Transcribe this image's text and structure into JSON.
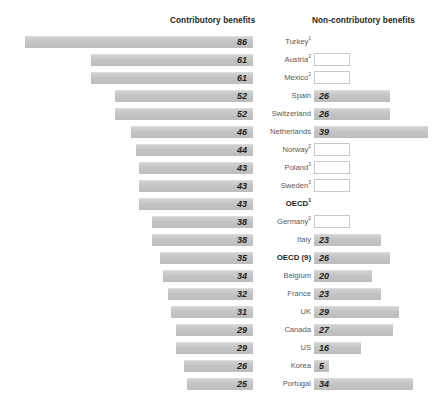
{
  "headers": {
    "left": "Contributory benefits",
    "right": "Non-contributory benefits"
  },
  "chart_data": {
    "type": "bar",
    "title": "",
    "subtitle": "",
    "orientation": "horizontal",
    "layout": "diverging-back-to-back",
    "xlabel": "",
    "ylabel": "",
    "grid": false,
    "legend_position": "top",
    "categories": [
      "Turkey",
      "Austria",
      "Mexico",
      "Spain",
      "Switzerland",
      "Netherlands",
      "Norway",
      "Poland",
      "Sweden",
      "OECD",
      "Germany",
      "Italy",
      "OECD (9)",
      "Belgium",
      "France",
      "UK",
      "Canada",
      "US",
      "Korea",
      "Portugal"
    ],
    "series": [
      {
        "name": "Contributory benefits",
        "values": [
          86,
          61,
          61,
          52,
          52,
          46,
          44,
          43,
          43,
          43,
          38,
          38,
          35,
          34,
          32,
          31,
          29,
          29,
          26,
          25
        ]
      },
      {
        "name": "Non-contributory benefits",
        "values": [
          null,
          null,
          null,
          26,
          26,
          39,
          null,
          null,
          null,
          null,
          null,
          23,
          26,
          20,
          23,
          29,
          27,
          16,
          5,
          34
        ]
      }
    ],
    "xlim_left": [
      0,
      86
    ],
    "xlim_right": [
      0,
      39
    ],
    "note": "Blank boxes indicate no value reported for non-contributory benefits"
  },
  "rows": [
    {
      "country": "Turkey",
      "superscript": "1",
      "bold": false,
      "left": 86,
      "right": null,
      "right_empty_box": false
    },
    {
      "country": "Austria",
      "superscript": "2",
      "bold": false,
      "left": 61,
      "right": null,
      "right_empty_box": true
    },
    {
      "country": "Mexico",
      "superscript": "2",
      "bold": false,
      "left": 61,
      "right": null,
      "right_empty_box": true
    },
    {
      "country": "Spain",
      "superscript": "",
      "bold": false,
      "left": 52,
      "right": 26,
      "right_empty_box": false
    },
    {
      "country": "Switzerland",
      "superscript": "",
      "bold": false,
      "left": 52,
      "right": 26,
      "right_empty_box": false
    },
    {
      "country": "Netherlands",
      "superscript": "",
      "bold": false,
      "left": 46,
      "right": 39,
      "right_empty_box": false
    },
    {
      "country": "Norway",
      "superscript": "2",
      "bold": false,
      "left": 44,
      "right": null,
      "right_empty_box": true
    },
    {
      "country": "Poland",
      "superscript": "3",
      "bold": false,
      "left": 43,
      "right": null,
      "right_empty_box": true
    },
    {
      "country": "Sweden",
      "superscript": "3",
      "bold": false,
      "left": 43,
      "right": null,
      "right_empty_box": true
    },
    {
      "country": "OECD",
      "superscript": "1",
      "bold": true,
      "left": 43,
      "right": null,
      "right_empty_box": false
    },
    {
      "country": "Germany",
      "superscript": "2",
      "bold": false,
      "left": 38,
      "right": null,
      "right_empty_box": true
    },
    {
      "country": "Italy",
      "superscript": "",
      "bold": false,
      "left": 38,
      "right": 23,
      "right_empty_box": false
    },
    {
      "country": "OECD (9)",
      "superscript": "",
      "bold": true,
      "left": 35,
      "right": 26,
      "right_empty_box": false
    },
    {
      "country": "Belgium",
      "superscript": "",
      "bold": false,
      "left": 34,
      "right": 20,
      "right_empty_box": false
    },
    {
      "country": "France",
      "superscript": "",
      "bold": false,
      "left": 32,
      "right": 23,
      "right_empty_box": false
    },
    {
      "country": "UK",
      "superscript": "",
      "bold": false,
      "left": 31,
      "right": 29,
      "right_empty_box": false
    },
    {
      "country": "Canada",
      "superscript": "",
      "bold": false,
      "left": 29,
      "right": 27,
      "right_empty_box": false
    },
    {
      "country": "US",
      "superscript": "",
      "bold": false,
      "left": 29,
      "right": 16,
      "right_empty_box": false
    },
    {
      "country": "Korea",
      "superscript": "",
      "bold": false,
      "left": 26,
      "right": 5,
      "right_empty_box": false
    },
    {
      "country": "Portugal",
      "superscript": "",
      "bold": false,
      "left": 25,
      "right": 34,
      "right_empty_box": false
    }
  ],
  "colors": {
    "bar_fill": "#c4c4c4",
    "bar_top_edge": "#dcdcdc",
    "value_text": "#231f20",
    "country_text": "#58585a",
    "header_text": "#231f20",
    "empty_box_border": "#c9c9c9",
    "background": "#ffffff"
  },
  "geometry": {
    "left_axis_end_x": 253,
    "right_axis_start_x": 314,
    "first_row_y": 33,
    "row_pitch": 18,
    "bar_height": 12,
    "left_px_per_unit": 2.65,
    "right_px_per_unit": 2.92
  }
}
